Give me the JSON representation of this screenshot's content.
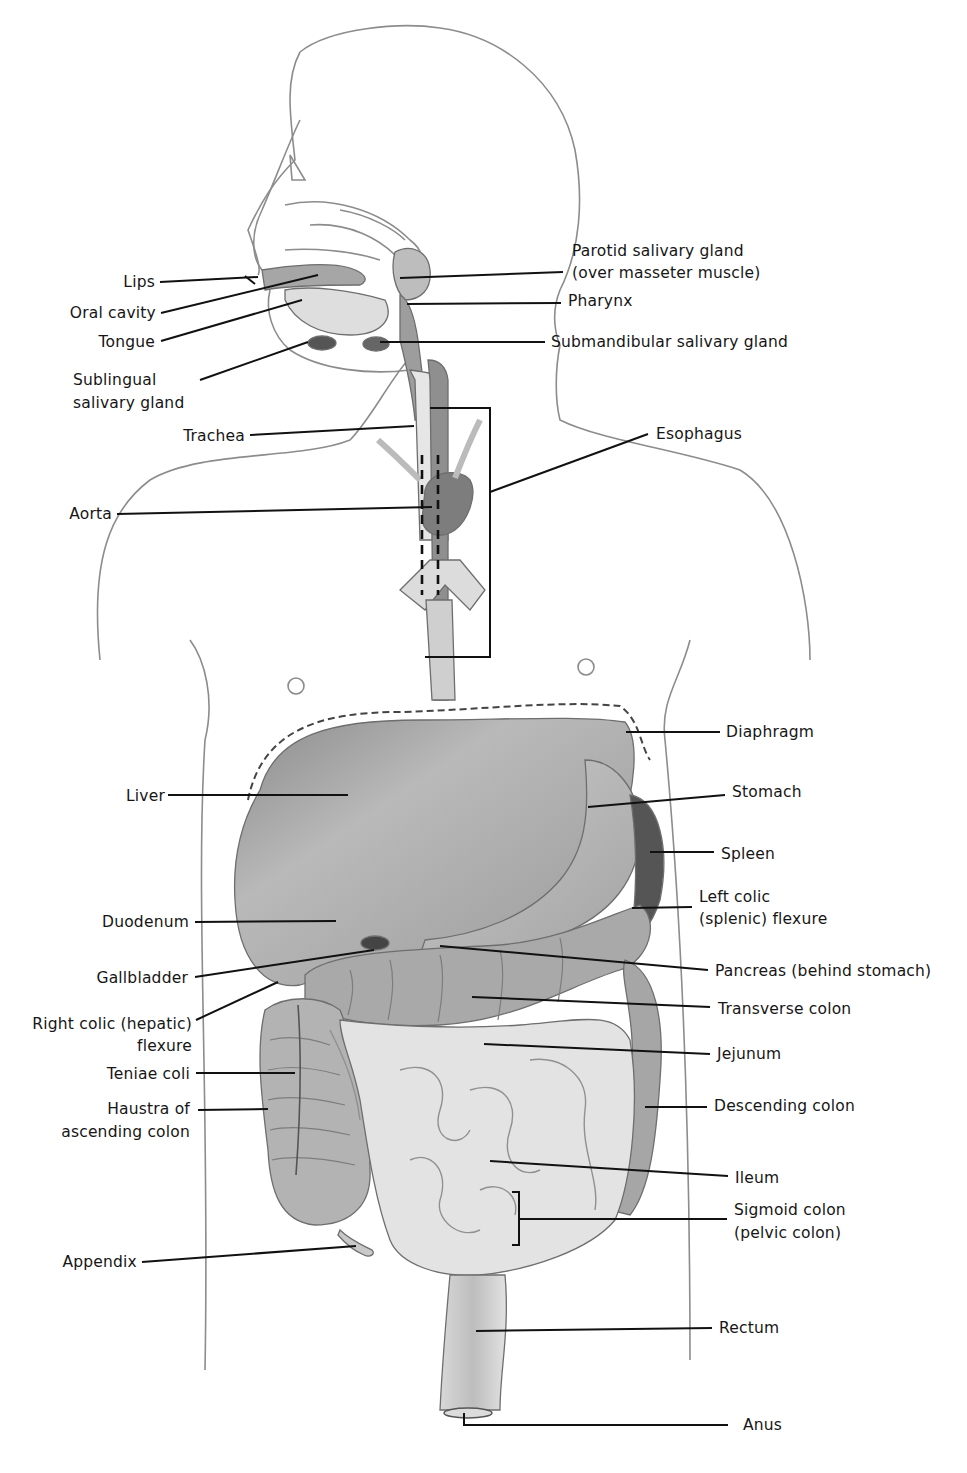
{
  "figure": {
    "labels": {
      "lips": "Lips",
      "oral_cavity": "Oral cavity",
      "tongue": "Tongue",
      "sublingual": [
        "Sublingual",
        "salivary gland"
      ],
      "trachea": "Trachea",
      "aorta": "Aorta",
      "parotid": [
        "Parotid salivary gland",
        "(over masseter muscle)"
      ],
      "pharynx": "Pharynx",
      "submandibular": "Submandibular salivary gland",
      "esophagus": "Esophagus",
      "diaphragm": "Diaphragm",
      "liver": "Liver",
      "stomach": "Stomach",
      "spleen": "Spleen",
      "left_colic": [
        "Left colic",
        "(splenic) flexure"
      ],
      "duodenum": "Duodenum",
      "gallbladder": "Gallbladder",
      "pancreas": "Pancreas (behind stomach)",
      "right_colic": [
        "Right colic (hepatic)",
        "flexure"
      ],
      "transverse_colon": "Transverse colon",
      "jejunum": "Jejunum",
      "teniae_coli": "Teniae coli",
      "haustra": [
        "Haustra of",
        "ascending colon"
      ],
      "descending_colon": "Descending colon",
      "ileum": "Ileum",
      "sigmoid_colon": [
        "Sigmoid colon",
        "(pelvic colon)"
      ],
      "appendix": "Appendix",
      "rectum": "Rectum",
      "anus": "Anus"
    }
  }
}
